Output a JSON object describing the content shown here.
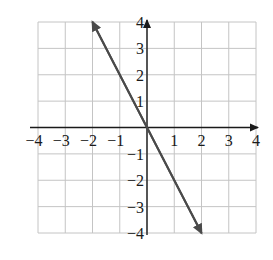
{
  "chart_data": {
    "type": "line",
    "title": "",
    "xlabel": "",
    "ylabel": "",
    "xlim": [
      -4,
      4
    ],
    "ylim": [
      -4,
      4
    ],
    "grid": true,
    "x_ticks": [
      -4,
      -3,
      -2,
      -1,
      1,
      2,
      3,
      4
    ],
    "y_ticks": [
      -4,
      -3,
      -2,
      -1,
      1,
      2,
      3,
      4
    ],
    "x_tick_labels": [
      "−4",
      "−3",
      "−2",
      "−1",
      "1",
      "2",
      "3",
      "4"
    ],
    "y_tick_labels": [
      "−4",
      "−3",
      "−2",
      "−1",
      "1",
      "2",
      "3",
      "4"
    ],
    "series": [
      {
        "name": "y = -2x",
        "x": [
          -2,
          0,
          2
        ],
        "y": [
          4,
          0,
          -4
        ],
        "arrows": "both",
        "color": "#4a4a4a"
      }
    ],
    "axes_arrows": {
      "x_positive": true,
      "y_positive": true
    }
  },
  "colors": {
    "grid": "#c4c4c4",
    "axis": "#1a1a1a",
    "line": "#4a4a4a"
  }
}
